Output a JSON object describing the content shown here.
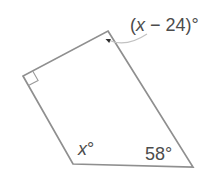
{
  "figure": {
    "shape": "quadrilateral",
    "angles": {
      "top": "(x − 24)°",
      "left": "90° (right-angle square marker)",
      "bottom_left": "x°",
      "bottom_right": "58°"
    },
    "labels": {
      "top": {
        "open": "(",
        "variable": "x",
        "rest": " − 24)°"
      },
      "bottom_left": {
        "variable": "x",
        "degree": "°"
      },
      "bottom_right": "58°"
    },
    "colors": {
      "line": "#8f8f8f",
      "marker": "#9a9a9a",
      "leader": "#c2c2c2",
      "arrow": "#2e2e2e",
      "text": "#4c4c4c",
      "background": "#ffffff"
    }
  }
}
